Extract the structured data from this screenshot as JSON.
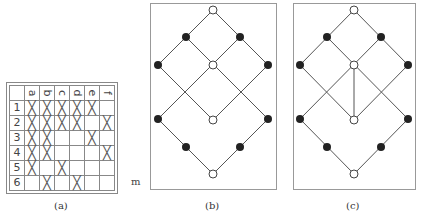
{
  "table": {
    "columns": [
      "a",
      "b",
      "c",
      "d",
      "e",
      "f"
    ],
    "rows": [
      {
        "label": "1",
        "marks": [
          "X",
          "X",
          "X",
          "X",
          "X",
          ""
        ]
      },
      {
        "label": "2",
        "marks": [
          "X",
          "X",
          "X",
          "X",
          "",
          "X"
        ]
      },
      {
        "label": "3",
        "marks": [
          "X",
          "X",
          "",
          "",
          "X",
          ""
        ]
      },
      {
        "label": "4",
        "marks": [
          "X",
          "X",
          "",
          "",
          "",
          "X"
        ]
      },
      {
        "label": "5",
        "marks": [
          "X",
          "",
          "X",
          "",
          "",
          ""
        ]
      },
      {
        "label": "6",
        "marks": [
          "",
          "X",
          "",
          "X",
          "",
          ""
        ]
      }
    ]
  },
  "captions": {
    "a": "(a)",
    "b": "(b)",
    "c": "(c)"
  },
  "stray_label": "m",
  "lattice": {
    "attributes": [
      "a",
      "b",
      "c",
      "d",
      "e",
      "f"
    ],
    "objects": [
      "1",
      "2",
      "3",
      "4",
      "5",
      "6"
    ]
  }
}
